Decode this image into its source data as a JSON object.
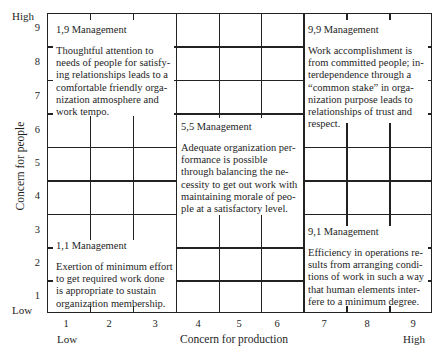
{
  "y_axis": {
    "label": "Concern for people",
    "high_label": "High",
    "low_label": "Low",
    "ticks": [
      "9",
      "8",
      "7",
      "6",
      "5",
      "4",
      "3",
      "2",
      "1"
    ]
  },
  "x_axis": {
    "label": "Concern for production",
    "high_label": "High",
    "low_label": "Low",
    "ticks": [
      "1",
      "2",
      "3",
      "4",
      "5",
      "6",
      "7",
      "8",
      "9"
    ]
  },
  "styles": [
    {
      "id": "1,9",
      "title": "1,9 Management",
      "description": "Thoughtful attention to needs of people for satisfying relationships leads to a comfortable friendly organization atmosphere and work tempo.",
      "lines": [
        "Thoughtful attention to",
        "needs of people for satisfy-",
        "ing relationships leads to a",
        "comfortable friendly orga-",
        "nization atmosphere and",
        "work tempo."
      ]
    },
    {
      "id": "9,9",
      "title": "9,9 Management",
      "description": "Work accomplishment is from committed people; interdependence through a \"common stake\" in organization purpose leads to relationships of trust and respect.",
      "lines": [
        "Work accomplishment is",
        "from committed people; in-",
        "terdependence through a",
        "“common stake” in orga-",
        "nization purpose leads to",
        "relationships of trust and",
        "respect."
      ]
    },
    {
      "id": "5,5",
      "title": "5,5 Management",
      "description": "Adequate organization performance is possible through balancing the necessity to get out work with maintaining morale of people at a satisfactory level.",
      "lines": [
        "Adequate organization per-",
        "formance is possible",
        "through balancing the ne-",
        "cessity to get out work with",
        "maintaining morale of peo-",
        "ple at a satisfactory level."
      ]
    },
    {
      "id": "1,1",
      "title": "1,1 Management",
      "description": "Exertion of minimum effort to get required work done is appropriate to sustain organization membership.",
      "lines": [
        "Exertion of minimum effort",
        "to get required work done",
        "is appropriate to sustain",
        "organization membership."
      ]
    },
    {
      "id": "9,1",
      "title": "9,1 Management",
      "description": "Efficiency in operations results from arranging conditions of work in such a way that human elements interfere to a minimum degree.",
      "lines": [
        "Efficiency in operations re-",
        "sults from arranging condi-",
        "tions of work in such a way",
        "that human elements inter-",
        "fere to a minimum degree."
      ]
    }
  ],
  "colors": {
    "line": "#222222",
    "background": "#ffffff",
    "text": "#1e1e1e"
  }
}
